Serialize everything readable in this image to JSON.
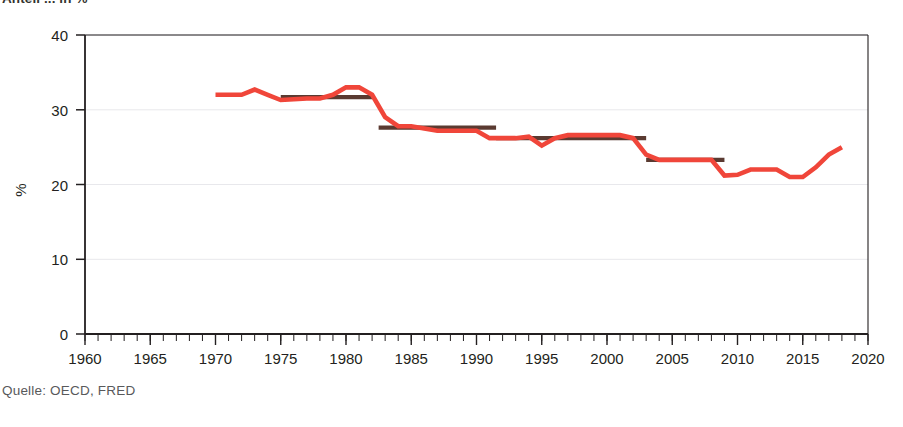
{
  "figure": {
    "title_partial": "Anteil ... in %",
    "source_label": "Quelle: OECD, FRED",
    "axis": {
      "ylabel": "%",
      "yticks": [
        "0",
        "10",
        "20",
        "30",
        "40"
      ],
      "xticks": [
        "1960",
        "1965",
        "1970",
        "1975",
        "1980",
        "1985",
        "1990",
        "1995",
        "2000",
        "2005",
        "2010",
        "2015",
        "2020"
      ]
    },
    "colors": {
      "series_line": "#f0463a",
      "period_average": "#5a3a31",
      "axis": "#231f20",
      "grid": "#e8e8ec",
      "source_text": "#58595b"
    }
  },
  "chart_data": {
    "type": "line",
    "title": "Anteil ... in %",
    "xlabel": "",
    "ylabel": "%",
    "xlim": [
      1960,
      2020
    ],
    "ylim": [
      0,
      40
    ],
    "yticks": [
      0,
      10,
      20,
      30,
      40
    ],
    "xticks": [
      1960,
      1965,
      1970,
      1975,
      1980,
      1985,
      1990,
      1995,
      2000,
      2005,
      2010,
      2015,
      2020
    ],
    "minor_xtick_step": 1,
    "grid": "horizontal",
    "legend": "none",
    "series": [
      {
        "name": "Jahreswert",
        "color": "#f0463a",
        "type": "line",
        "x": [
          1970,
          1971,
          1972,
          1973,
          1974,
          1975,
          1976,
          1977,
          1978,
          1979,
          1980,
          1981,
          1982,
          1983,
          1984,
          1985,
          1986,
          1987,
          1988,
          1989,
          1990,
          1991,
          1992,
          1993,
          1994,
          1995,
          1996,
          1997,
          1998,
          1999,
          2000,
          2001,
          2002,
          2003,
          2004,
          2005,
          2006,
          2007,
          2008,
          2009,
          2010,
          2011,
          2012,
          2013,
          2014,
          2015,
          2016,
          2017,
          2018
        ],
        "values": [
          32.0,
          32.0,
          32.0,
          32.7,
          32.0,
          31.3,
          31.4,
          31.5,
          31.5,
          32.0,
          33.0,
          33.0,
          32.0,
          29.0,
          27.8,
          27.8,
          27.5,
          27.2,
          27.2,
          27.2,
          27.2,
          26.2,
          26.2,
          26.2,
          26.4,
          25.2,
          26.2,
          26.6,
          26.6,
          26.6,
          26.6,
          26.6,
          26.2,
          24.0,
          23.3,
          23.3,
          23.3,
          23.3,
          23.3,
          21.2,
          21.3,
          22.0,
          22.0,
          22.0,
          21.0,
          21.0,
          22.3,
          24.0,
          25.0
        ]
      },
      {
        "name": "Periodendurchschnitt",
        "color": "#5a3a31",
        "type": "step-segments",
        "segments": [
          {
            "x_start": 1975,
            "x_end": 1982,
            "value": 31.7
          },
          {
            "x_start": 1982.5,
            "x_end": 1991.5,
            "value": 27.6
          },
          {
            "x_start": 1991.5,
            "x_end": 2003,
            "value": 26.2
          },
          {
            "x_start": 2003,
            "x_end": 2009,
            "value": 23.3
          }
        ]
      }
    ]
  }
}
